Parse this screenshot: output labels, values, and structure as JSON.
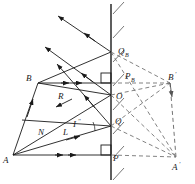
{
  "figure": {
    "kind": "optics-reflection-geometry-diagram",
    "background_color": "#ffffff",
    "stroke_color": "#1a1a1a",
    "dash_color": "#6b6b6b"
  },
  "labels": {
    "A": "A",
    "B": "B",
    "A_prime": "A",
    "A_prime_mark": "'",
    "B_prime": "B",
    "B_prime_mark": "'",
    "O": "O",
    "P": "P",
    "Q": "Q",
    "Q_B_base": "Q",
    "Q_B_sub": "B",
    "P_B_base": "P",
    "P_B_sub": "B",
    "N": "N",
    "L": "L",
    "R": "R",
    "I_base": "I",
    "I_mark": "''"
  },
  "geometry": {
    "mirror": {
      "x": 111,
      "y_top": 4,
      "y_bottom": 180
    },
    "points": {
      "A": {
        "x": 13,
        "y": 155
      },
      "B": {
        "x": 38,
        "y": 83
      },
      "O": {
        "x": 111,
        "y": 95
      },
      "P": {
        "x": 111,
        "y": 155
      },
      "Q": {
        "x": 111,
        "y": 126
      },
      "Q_B": {
        "x": 111,
        "y": 52
      },
      "P_B": {
        "x": 111,
        "y": 83
      },
      "A_prime": {
        "x": 176,
        "y": 157
      },
      "B_prime": {
        "x": 170,
        "y": 83
      }
    },
    "hatch_count": 7,
    "arrow_marker_count_per_line": 2
  },
  "elements": [
    {
      "name": "mirror-line",
      "type": "solid-line"
    },
    {
      "name": "mirror-hatching",
      "type": "hatch-marks"
    },
    {
      "name": "incident-ray-A-Q",
      "type": "solid-arrow"
    },
    {
      "name": "incident-ray-A-O",
      "type": "solid-arrow"
    },
    {
      "name": "incident-ray-B-QB",
      "type": "solid-arrow"
    },
    {
      "name": "reflected-ray-Q",
      "type": "solid-arrow"
    },
    {
      "name": "reflected-ray-O",
      "type": "solid-arrow"
    },
    {
      "name": "reflected-ray-QB",
      "type": "solid-arrow"
    },
    {
      "name": "normal-line-N",
      "type": "solid-line"
    },
    {
      "name": "chief-ray-A-P",
      "type": "solid-line-with-double-arrow"
    },
    {
      "name": "chief-ray-B-PB",
      "type": "solid-line-with-double-arrow"
    },
    {
      "name": "virtual-ray-P-Aprime",
      "type": "dashed-line"
    },
    {
      "name": "virtual-ray-Q-Aprime",
      "type": "dashed-line"
    },
    {
      "name": "virtual-ray-O-Aprime",
      "type": "dashed-line"
    },
    {
      "name": "virtual-ray-PB-Bprime",
      "type": "dashed-line"
    },
    {
      "name": "virtual-ray-O-Bprime",
      "type": "dashed-line"
    },
    {
      "name": "virtual-ray-QB-Bprime",
      "type": "dashed-line"
    },
    {
      "name": "image-segment-Aprime-Bprime",
      "type": "dashed-arrow"
    },
    {
      "name": "object-segment-A-B",
      "type": "solid-line"
    },
    {
      "name": "right-angle-marker-P",
      "type": "square-marker"
    },
    {
      "name": "right-angle-marker-PB",
      "type": "square-marker"
    }
  ]
}
